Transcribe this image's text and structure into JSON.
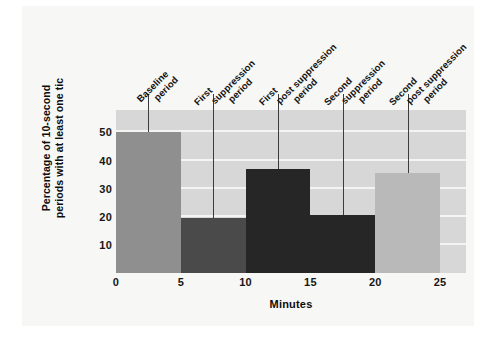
{
  "chart_data": {
    "type": "bar",
    "title": "",
    "xlabel": "Minutes",
    "ylabel": "Percentage of 10-second periods with at least one tic",
    "ylabel_lines": [
      "Percentage of 10-second periods",
      "with at least one tic"
    ],
    "xlim": [
      0,
      27
    ],
    "ylim": [
      0,
      58
    ],
    "yticks": [
      10,
      20,
      30,
      40,
      50
    ],
    "xticks": [
      0,
      5,
      10,
      15,
      20,
      25
    ],
    "grid": true,
    "grid_axis": "y",
    "legend": "none",
    "plot_background": "#d7d7d7",
    "categories": [
      "Baseline period",
      "First suppression period",
      "First post suppression period",
      "Second suppression period",
      "Second post suppression period"
    ],
    "values": [
      50,
      19.5,
      37,
      20.5,
      35.5
    ],
    "bars": [
      {
        "label": "Baseline period",
        "label_lines": [
          "Baseline",
          "period"
        ],
        "x_start": 0,
        "x_end": 5,
        "value": 50,
        "color": "#8f8f8f",
        "leader_x": 2.5
      },
      {
        "label": "First suppression period",
        "label_lines": [
          "First",
          "suppression",
          "period"
        ],
        "x_start": 5,
        "x_end": 10,
        "value": 19.5,
        "color": "#4a4a4a",
        "leader_x": 7.5
      },
      {
        "label": "First post suppression period",
        "label_lines": [
          "First",
          "post suppression",
          "period"
        ],
        "x_start": 10,
        "x_end": 15,
        "value": 37,
        "color": "#262626",
        "leader_x": 12.5
      },
      {
        "label": "Second suppression period",
        "label_lines": [
          "Second",
          "suppression",
          "period"
        ],
        "x_start": 15,
        "x_end": 20,
        "value": 20.5,
        "color": "#262626",
        "leader_x": 17.5
      },
      {
        "label": "Second post suppression period",
        "label_lines": [
          "Second",
          "post suppression",
          "period"
        ],
        "x_start": 20,
        "x_end": 25,
        "value": 35.5,
        "color": "#b9b9b9",
        "leader_x": 22.5
      }
    ]
  }
}
